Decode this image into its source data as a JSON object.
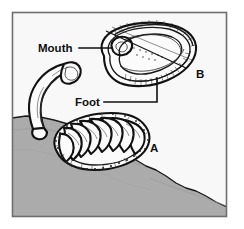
{
  "figure": {
    "kind": "scientific-line-illustration",
    "border": {
      "visible": true,
      "color": "#6e6e6e"
    },
    "colors": {
      "page_background": "#ffffff",
      "panel_background": "#f8f8f8",
      "rock_fill": "#ababab",
      "rock_shadow": "#9a9a9a",
      "ink": "#111111",
      "shell_fill": "#fbfbfb"
    },
    "callouts": [
      {
        "id": "mouth",
        "label": "Mouth",
        "text_x": 38,
        "text_y": 52,
        "leader": "M 79 48 L 112 48",
        "points_to": "anterior mouth opening of ventral specimen B"
      },
      {
        "id": "foot",
        "label": "Foot",
        "text_x": 75,
        "text_y": 106,
        "leader": "M 104 102 L 157 102 L 157 78",
        "points_to": "broad muscular foot of ventral specimen B"
      }
    ],
    "markers": [
      {
        "id": "a",
        "label": "A",
        "text_x": 150,
        "text_y": 152,
        "describes": "dorsal view of chiton clinging to rock, eight overlapping shell plates"
      },
      {
        "id": "b",
        "label": "B",
        "text_x": 196,
        "text_y": 78,
        "describes": "ventral view of chiton showing foot, girdle and mouth"
      }
    ],
    "specimens": [
      {
        "id": "a",
        "view": "dorsal",
        "plate_count": 8,
        "position": "lower-left, resting on rock",
        "features": [
          "eight articulating shell valves",
          "speckled girdle"
        ]
      },
      {
        "id": "b",
        "view": "ventral",
        "position": "upper-right",
        "features": [
          "mouth",
          "foot",
          "gill groove",
          "girdle"
        ]
      },
      {
        "id": "detached-plate",
        "view": "curled / arched shell band",
        "position": "left, above rock edge",
        "features": [
          "single curved valve",
          "arched body"
        ]
      }
    ],
    "rock": {
      "description": "gray rock surface sloping from upper-left to lower-right",
      "label": "rock substrate"
    }
  }
}
